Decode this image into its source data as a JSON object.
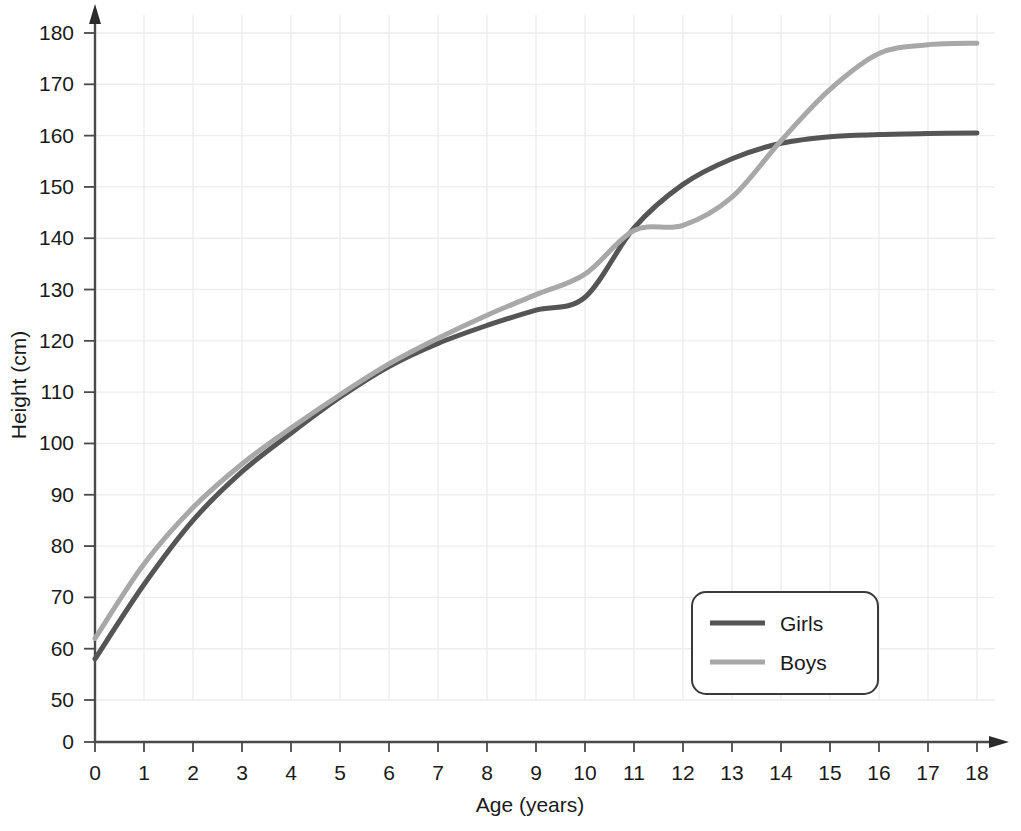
{
  "chart_data": {
    "type": "line",
    "title": "",
    "xlabel": "Age (years)",
    "ylabel": "Height (cm)",
    "xlim": [
      0,
      18
    ],
    "ylim": [
      50,
      180
    ],
    "y_axis_break": true,
    "y_zero_label": "0",
    "grid": true,
    "legend_position": "bottom-right",
    "xticks": [
      "0",
      "1",
      "2",
      "3",
      "4",
      "5",
      "6",
      "7",
      "8",
      "9",
      "10",
      "11",
      "12",
      "13",
      "14",
      "15",
      "16",
      "17",
      "18"
    ],
    "yticks": [
      "0",
      "50",
      "60",
      "70",
      "80",
      "90",
      "100",
      "110",
      "120",
      "130",
      "140",
      "150",
      "160",
      "170",
      "180"
    ],
    "x": [
      0,
      1,
      2,
      3,
      4,
      5,
      6,
      7,
      8,
      9,
      10,
      11,
      12,
      13,
      14,
      15,
      16,
      17,
      18
    ],
    "series": [
      {
        "name": "Girls",
        "color": "#555555",
        "values": [
          58,
          72.5,
          85,
          94.5,
          102,
          109,
          115,
          119.5,
          123,
          126,
          128.5,
          142,
          150.5,
          155.5,
          158.5,
          159.8,
          160.2,
          160.4,
          160.5
        ]
      },
      {
        "name": "Boys",
        "color": "#a8a8a8",
        "values": [
          62,
          76.5,
          87.5,
          96,
          103,
          109.5,
          115.5,
          120.5,
          125,
          129,
          133,
          141.5,
          142.5,
          148,
          159,
          169,
          176,
          177.7,
          178
        ]
      }
    ],
    "annotations": [
      "Girls' growth spurt occurs around ages 10-12",
      "Boys' growth spurt occurs around ages 13-16",
      "Curves cross near age 11 and again near age 14"
    ]
  },
  "legend": {
    "entries": [
      {
        "label": "Girls"
      },
      {
        "label": "Boys"
      }
    ]
  },
  "axes": {
    "x_title": "Age (years)",
    "y_title": "Height (cm)"
  }
}
